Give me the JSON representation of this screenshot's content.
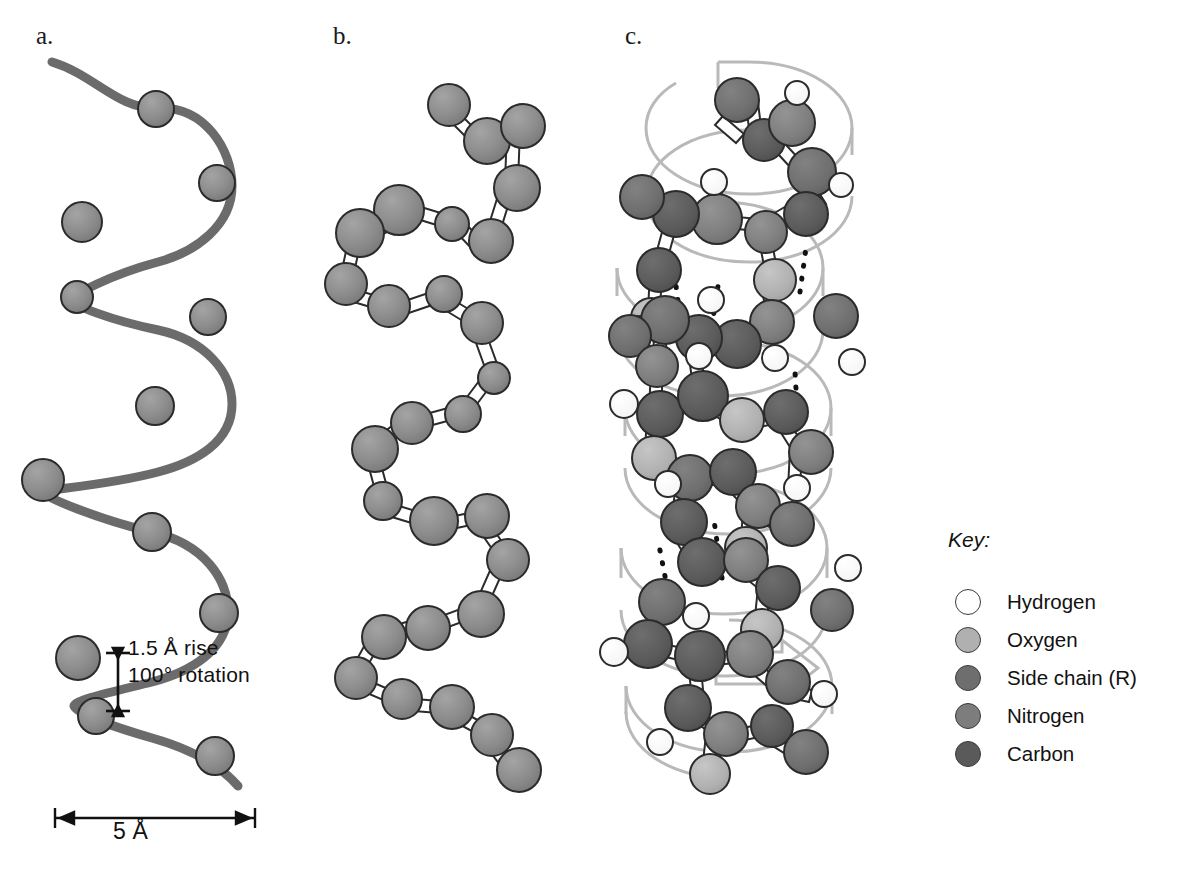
{
  "figure": {
    "panels": [
      {
        "id": "a",
        "label": "a.",
        "type": "ribbon-helix-backbone-trace"
      },
      {
        "id": "b",
        "label": "b.",
        "type": "ball-and-stick-backbone"
      },
      {
        "id": "c",
        "label": "c.",
        "type": "full-atomic-model-with-helix-band"
      }
    ]
  },
  "annotations": {
    "rise_line1": "1.5 Å rise",
    "rise_line2": "100° rotation",
    "diameter": "5 Å"
  },
  "key": {
    "title": "Key:",
    "items": [
      {
        "label": "Hydrogen",
        "color": "#ffffff"
      },
      {
        "label": "Oxygen",
        "color": "#b0b0b0"
      },
      {
        "label": "Side chain (R)",
        "color": "#6e6e6e"
      },
      {
        "label": "Nitrogen",
        "color": "#7d7d7d"
      },
      {
        "label": "Carbon",
        "color": "#5a5a5a"
      }
    ]
  },
  "colors": {
    "ribbon_trace": "#6b6b6b",
    "sphere_gray": "#8a8a8a",
    "sphere_outline": "#2b2b2b",
    "helix_band": "#b9b9b9",
    "bond_white": "#ffffff",
    "hbond_dots": "#111111",
    "background": "#ffffff"
  }
}
